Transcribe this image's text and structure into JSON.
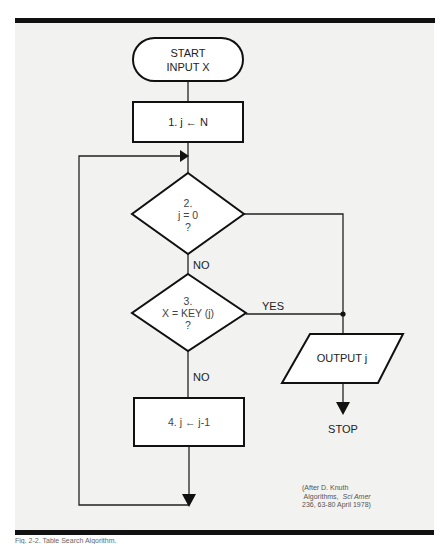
{
  "flowchart": {
    "start": {
      "line1": "START",
      "line2": "INPUT X"
    },
    "step1": {
      "label": "1. j ← N"
    },
    "decision2": {
      "num": "2.",
      "expr": "j = 0",
      "q": "?"
    },
    "decision2_no": "NO",
    "decision3": {
      "num": "3.",
      "expr": "X = KEY (j)",
      "q": "?"
    },
    "decision3_yes": "YES",
    "decision3_no": "NO",
    "step4": {
      "label": "4. j ← j-1"
    },
    "output": {
      "label": "OUTPUT j"
    },
    "stop": {
      "label": "STOP"
    }
  },
  "citation": {
    "line1": "(After D. Knuth",
    "line2a": " Algorithms,  ",
    "line2b": "Sci Amer",
    "line3": "236, 63-80 April 1978)"
  },
  "caption": "Fig. 2-2. Table Search Algorithm."
}
